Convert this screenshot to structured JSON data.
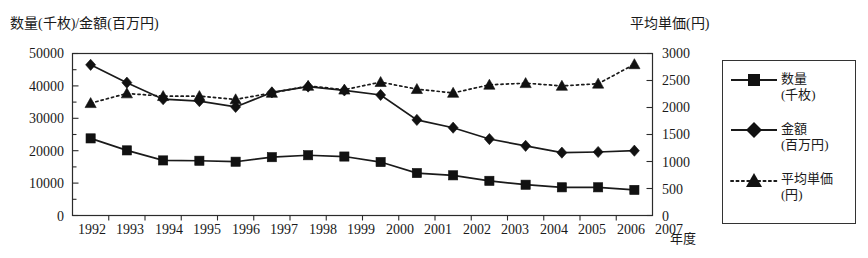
{
  "chart_data": {
    "type": "line",
    "title": "",
    "left_axis_label": "数量(千枚)/金額(百万円)",
    "right_axis_label": "平均単価(円)",
    "xlabel": "年度",
    "categories": [
      "1992",
      "1993",
      "1994",
      "1995",
      "1996",
      "1997",
      "1998",
      "1999",
      "2000",
      "2001",
      "2002",
      "2003",
      "2004",
      "2005",
      "2006",
      "2007"
    ],
    "left_ylim": [
      0,
      50000
    ],
    "left_yticks": [
      "0",
      "10000",
      "20000",
      "30000",
      "40000",
      "50000"
    ],
    "right_ylim": [
      0,
      3000
    ],
    "right_yticks": [
      "0",
      "500",
      "1000",
      "1500",
      "2000",
      "2500",
      "3000"
    ],
    "grid": false,
    "legend_position": "right-outside",
    "series": [
      {
        "name": "数量",
        "unit": "(千枚)",
        "legend_label_line1": "数量",
        "legend_label_line2": "(千枚)",
        "axis": "left",
        "marker": "square",
        "linestyle": "solid",
        "values": [
          23800,
          20100,
          17000,
          16900,
          16600,
          18000,
          18600,
          18200,
          16500,
          13100,
          12400,
          10700,
          9500,
          8700,
          8700,
          7900
        ]
      },
      {
        "name": "金額",
        "unit": "(百万円)",
        "legend_label_line1": "金額",
        "legend_label_line2": "(百万円)",
        "axis": "left",
        "marker": "diamond",
        "linestyle": "solid",
        "values": [
          46500,
          41000,
          35900,
          35300,
          33500,
          38000,
          39800,
          38600,
          37200,
          29500,
          27100,
          23600,
          21500,
          19400,
          19600,
          20000
        ]
      },
      {
        "name": "平均単価",
        "unit": "(円)",
        "legend_label_line1": "平均単価",
        "legend_label_line2": "(円)",
        "axis": "right",
        "marker": "triangle",
        "linestyle": "dotted",
        "values": [
          2080,
          2260,
          2210,
          2210,
          2150,
          2270,
          2400,
          2330,
          2470,
          2340,
          2270,
          2420,
          2450,
          2400,
          2440,
          2800
        ]
      }
    ]
  },
  "legend": {
    "items": [
      {
        "label_line1": "数量",
        "label_line2": "(千枚)",
        "marker": "square-marker-icon"
      },
      {
        "label_line1": "金額",
        "label_line2": "(百万円)",
        "marker": "diamond-marker-icon"
      },
      {
        "label_line1": "平均単価",
        "label_line2": "(円)",
        "marker": "triangle-marker-icon"
      }
    ]
  },
  "colors": {
    "ink": "#1a1a1a",
    "axis": "#2b2b2b",
    "background": "#ffffff"
  }
}
